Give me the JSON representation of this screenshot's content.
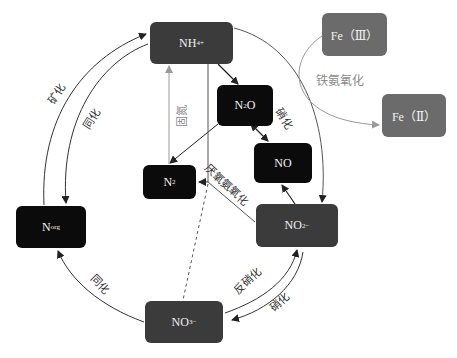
{
  "nodes": {
    "nh4": {
      "base": "NH",
      "sub": "4",
      "sup": "+"
    },
    "fe3": {
      "label": "Fe（Ⅲ）"
    },
    "fe2": {
      "label": "Fe（Ⅱ）"
    },
    "n2o": {
      "base": "N",
      "sub": "2",
      "tail": "O"
    },
    "no": {
      "label": "NO"
    },
    "n2": {
      "base": "N",
      "sub": "2"
    },
    "norg": {
      "base": "N",
      "sub": "org"
    },
    "no2": {
      "base": "NO",
      "sub": "2",
      "sup": "−"
    },
    "no3": {
      "base": "NO",
      "sub": "3",
      "sup": "−"
    }
  },
  "labels": {
    "mineralization": "矿化",
    "assimilation_top": "同化",
    "assimilation_bottom": "同化",
    "nitrification_top": "硝化",
    "nitrification_bottom": "硝化",
    "denitrification": "反硝化",
    "anammox": "厌氧氨氧化",
    "fixation": "固氮",
    "feammox": "铁氨氧化"
  },
  "colors": {
    "black_node": "#0b0b0b",
    "dark_node": "#3b3b3b",
    "gray_node": "#6b6b6b",
    "edge": "#333333",
    "light_edge": "#9a9a9a"
  }
}
